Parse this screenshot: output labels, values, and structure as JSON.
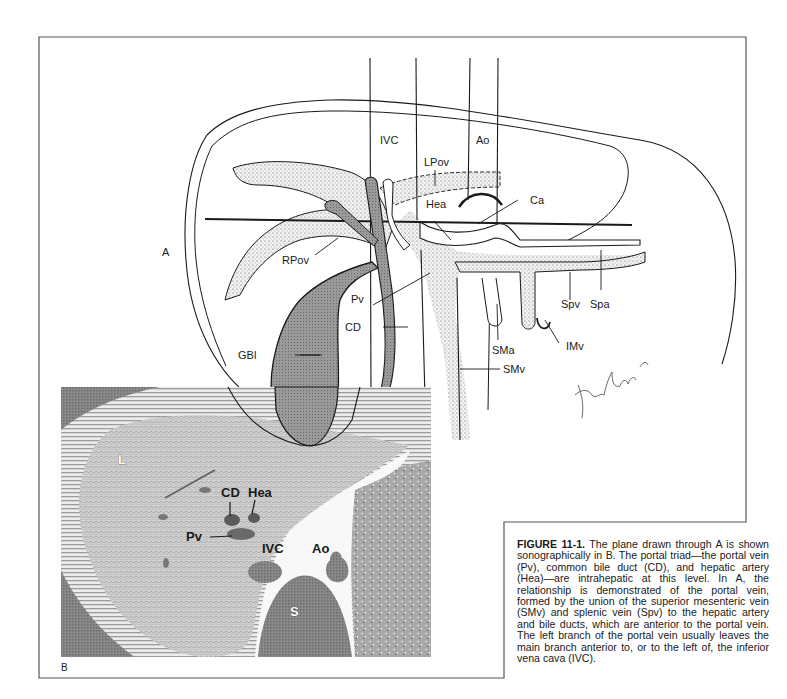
{
  "figure": {
    "panel_a_letter": "A",
    "panel_b_letter": "B",
    "labels_a": {
      "ivc": "IVC",
      "ao": "Ao",
      "lpov": "LPov",
      "hea": "Hea",
      "ca": "Ca",
      "rpov": "RPov",
      "pv": "Pv",
      "cd": "CD",
      "gbl": "GBl",
      "spv": "Spv",
      "spa": "Spa",
      "sma": "SMa",
      "imv": "IMv",
      "smv": "SMv"
    },
    "labels_b": {
      "l": "L",
      "cd": "CD",
      "hea": "Hea",
      "pv": "Pv",
      "ivc": "IVC",
      "ao": "Ao",
      "s": "S"
    },
    "signature": "Xenakis"
  },
  "caption": {
    "figure_number": "FIGURE 11-1.",
    "text": " The plane drawn through A is shown sonographically in B. The portal triad—the portal vein (Pv), common bile duct (CD), and hepatic artery (Hea)—are intrahepatic at this level. In A, the relationship is demonstrated of the portal vein, formed by the union of the superior mesenteric vein (SMv) and splenic vein (Spv) to the hepatic artery and bile ducts, which are anterior to the portal vein. The left branch of the portal vein usually leaves the main branch anterior to, or to the left of, the inferior vena cava (IVC)."
  },
  "colors": {
    "ink": "#1a1a1a",
    "stipple_fill": "#e4e4e4",
    "dark_duct": "#8c8c8c",
    "gallbladder": "#9a9a9a",
    "us_liver": "#c8c8c8",
    "us_dark": "#7a7a7a"
  }
}
